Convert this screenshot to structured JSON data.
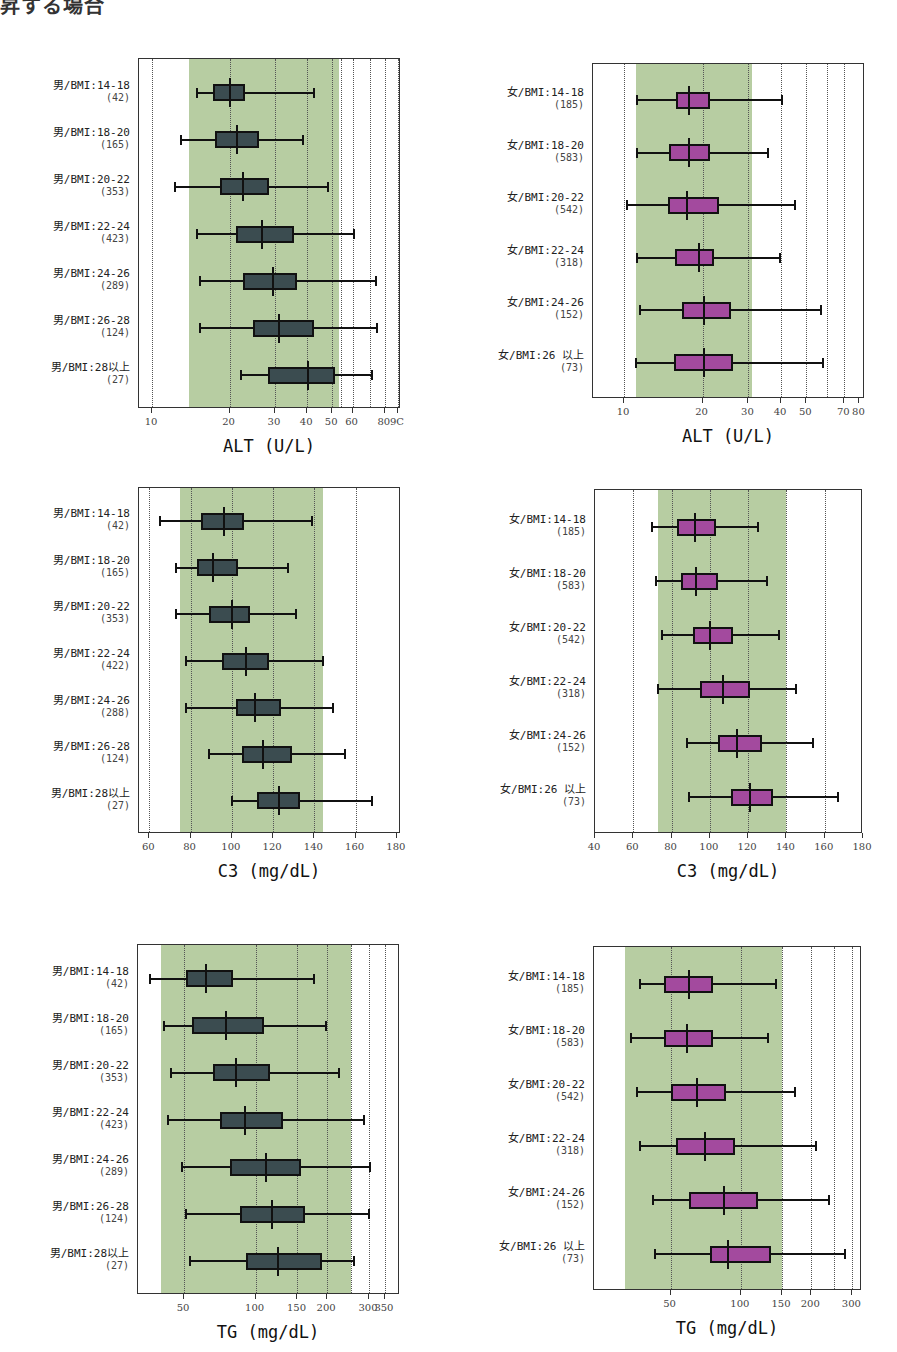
{
  "header": {
    "text": "昇する場合"
  },
  "colors": {
    "band": "#b7cda2",
    "male_box": "#3b4c50",
    "female_box": "#a34a9e",
    "axis": "#333333"
  },
  "chart_data": [
    {
      "id": "alt-male",
      "type": "boxplot",
      "scale": "log",
      "xlabel": "ALT (U/L)",
      "plot": {
        "left": 138,
        "top": 58,
        "width": 262,
        "height": 350
      },
      "domain": [
        8.9,
        92.5
      ],
      "ticks": [
        10,
        20,
        30,
        40,
        50,
        60,
        80,
        90
      ],
      "tick_labels": [
        "10",
        "20",
        "30",
        "40",
        "50",
        "60",
        "80",
        "9C"
      ],
      "grid": [
        10,
        20,
        30,
        40,
        50,
        54,
        60,
        70,
        80,
        90
      ],
      "reference_band": [
        13.9,
        53
      ],
      "box_color": "#3b4c50",
      "rows": [
        {
          "label": "男/BMI:14-18",
          "n": "(42)",
          "min": 14.9,
          "q1": 17.2,
          "median": 20.0,
          "q3": 22.9,
          "max": 42.5
        },
        {
          "label": "男/BMI:18-20",
          "n": "(165)",
          "min": 13.0,
          "q1": 17.5,
          "median": 21.3,
          "q3": 25.9,
          "max": 38.4
        },
        {
          "label": "男/BMI:20-22",
          "n": "(353)",
          "min": 12.3,
          "q1": 18.3,
          "median": 22.6,
          "q3": 28.4,
          "max": 48.2
        },
        {
          "label": "男/BMI:22-24",
          "n": "(423)",
          "min": 14.9,
          "q1": 21.1,
          "median": 26.7,
          "q3": 35.5,
          "max": 60.6
        },
        {
          "label": "男/BMI:24-26",
          "n": "(289)",
          "min": 15.4,
          "q1": 22.6,
          "median": 29.4,
          "q3": 36.4,
          "max": 74.2
        },
        {
          "label": "男/BMI:26-28",
          "n": "(124)",
          "min": 15.4,
          "q1": 24.7,
          "median": 31.0,
          "q3": 42.6,
          "max": 74.7
        },
        {
          "label": "男/BMI:28以上",
          "n": "(27)",
          "min": 22.1,
          "q1": 28.2,
          "median": 40.4,
          "q3": 51.3,
          "max": 71.4
        }
      ]
    },
    {
      "id": "alt-female",
      "type": "boxplot",
      "scale": "log",
      "xlabel": "ALT (U/L)",
      "plot": {
        "left": 592,
        "top": 63,
        "width": 272,
        "height": 335
      },
      "domain": [
        7.6,
        84
      ],
      "ticks": [
        10,
        20,
        30,
        40,
        50,
        70,
        80
      ],
      "tick_labels": [
        "10",
        "20",
        "30",
        "40",
        "50",
        "70",
        "80"
      ],
      "grid": [
        10,
        20,
        30,
        40,
        50,
        60,
        70
      ],
      "reference_band": [
        11.1,
        30.9
      ],
      "box_color": "#a34a9e",
      "rows": [
        {
          "label": "女/BMI:14-18",
          "n": "(185)",
          "min": 11.2,
          "q1": 15.8,
          "median": 17.7,
          "q3": 21.4,
          "max": 40.4
        },
        {
          "label": "女/BMI:18-20",
          "n": "(583)",
          "min": 11.2,
          "q1": 14.9,
          "median": 17.7,
          "q3": 21.4,
          "max": 35.7
        },
        {
          "label": "女/BMI:20-22",
          "n": "(542)",
          "min": 10.3,
          "q1": 14.8,
          "median": 17.5,
          "q3": 23.2,
          "max": 45.4
        },
        {
          "label": "女/BMI:22-24",
          "n": "(318)",
          "min": 11.2,
          "q1": 15.7,
          "median": 19.3,
          "q3": 22.2,
          "max": 39.6
        },
        {
          "label": "女/BMI:24-26",
          "n": "(152)",
          "min": 11.5,
          "q1": 16.7,
          "median": 20.2,
          "q3": 25.7,
          "max": 57.1
        },
        {
          "label": "女/BMI:26 以上",
          "n": "(73)",
          "min": 11.1,
          "q1": 15.5,
          "median": 20.2,
          "q3": 26.1,
          "max": 58.0
        }
      ]
    },
    {
      "id": "c3-male",
      "type": "boxplot",
      "scale": "linear",
      "xlabel": "C3 (mg/dL)",
      "plot": {
        "left": 138,
        "top": 487,
        "width": 262,
        "height": 346
      },
      "domain": [
        55,
        182
      ],
      "ticks": [
        60,
        80,
        100,
        120,
        140,
        160,
        180
      ],
      "tick_labels": [
        "60",
        "80",
        "100",
        "120",
        "140",
        "160",
        "180"
      ],
      "grid": [
        60,
        80,
        100,
        120,
        140,
        160
      ],
      "reference_band": [
        75,
        144
      ],
      "box_color": "#3b4c50",
      "rows": [
        {
          "label": "男/BMI:14-18",
          "n": "(42)",
          "min": 65,
          "q1": 85,
          "median": 96,
          "q3": 106,
          "max": 139
        },
        {
          "label": "男/BMI:18-20",
          "n": "(165)",
          "min": 73,
          "q1": 83,
          "median": 91,
          "q3": 103,
          "max": 127
        },
        {
          "label": "男/BMI:20-22",
          "n": "(353)",
          "min": 73,
          "q1": 89,
          "median": 100,
          "q3": 109,
          "max": 131
        },
        {
          "label": "男/BMI:22-24",
          "n": "(422)",
          "min": 78,
          "q1": 95,
          "median": 107,
          "q3": 118,
          "max": 144
        },
        {
          "label": "男/BMI:24-26",
          "n": "(288)",
          "min": 78,
          "q1": 102,
          "median": 111,
          "q3": 124,
          "max": 149
        },
        {
          "label": "男/BMI:26-28",
          "n": "(124)",
          "min": 89,
          "q1": 105,
          "median": 115,
          "q3": 129,
          "max": 155
        },
        {
          "label": "男/BMI:28以上",
          "n": "(27)",
          "min": 100,
          "q1": 112,
          "median": 123,
          "q3": 133,
          "max": 168
        }
      ]
    },
    {
      "id": "c3-female",
      "type": "boxplot",
      "scale": "linear",
      "xlabel": "C3 (mg/dL)",
      "plot": {
        "left": 594,
        "top": 489,
        "width": 268,
        "height": 344
      },
      "domain": [
        40,
        180
      ],
      "ticks": [
        40,
        60,
        80,
        100,
        120,
        140,
        160,
        180
      ],
      "tick_labels": [
        "40",
        "60",
        "80",
        "100",
        "120",
        "140",
        "160",
        "180"
      ],
      "grid": [
        60,
        80,
        100,
        120,
        140,
        160
      ],
      "reference_band": [
        73,
        140
      ],
      "box_color": "#a34a9e",
      "rows": [
        {
          "label": "女/BMI:14-18",
          "n": "(185)",
          "min": 70,
          "q1": 83,
          "median": 92,
          "q3": 103,
          "max": 125
        },
        {
          "label": "女/BMI:18-20",
          "n": "(583)",
          "min": 72,
          "q1": 85,
          "median": 93,
          "q3": 104,
          "max": 130
        },
        {
          "label": "女/BMI:20-22",
          "n": "(542)",
          "min": 75,
          "q1": 91,
          "median": 100,
          "q3": 112,
          "max": 136
        },
        {
          "label": "女/BMI:22-24",
          "n": "(318)",
          "min": 73,
          "q1": 95,
          "median": 107,
          "q3": 121,
          "max": 145
        },
        {
          "label": "女/BMI:24-26",
          "n": "(152)",
          "min": 88,
          "q1": 104,
          "median": 114,
          "q3": 127,
          "max": 154
        },
        {
          "label": "女/BMI:26 以上",
          "n": "(73)",
          "min": 89,
          "q1": 111,
          "median": 121,
          "q3": 133,
          "max": 167
        }
      ]
    },
    {
      "id": "tg-male",
      "type": "boxplot",
      "scale": "log",
      "xlabel": "TG (mg/dL)",
      "plot": {
        "left": 137,
        "top": 944,
        "width": 262,
        "height": 350
      },
      "domain": [
        32,
        405
      ],
      "ticks": [
        50,
        100,
        150,
        200,
        300,
        350
      ],
      "tick_labels": [
        "50",
        "100",
        "150",
        "200",
        "300",
        "350"
      ],
      "grid": [
        50,
        100,
        150,
        200,
        252,
        300,
        350
      ],
      "reference_band": [
        40,
        252
      ],
      "box_color": "#3b4c50",
      "rows": [
        {
          "label": "男/BMI:14-18",
          "n": "(42)",
          "min": 36,
          "q1": 51,
          "median": 62,
          "q3": 80,
          "max": 176
        },
        {
          "label": "男/BMI:18-20",
          "n": "(165)",
          "min": 41,
          "q1": 54,
          "median": 75,
          "q3": 108,
          "max": 197
        },
        {
          "label": "男/BMI:20-22",
          "n": "(353)",
          "min": 44,
          "q1": 66,
          "median": 83,
          "q3": 115,
          "max": 225
        },
        {
          "label": "男/BMI:22-24",
          "n": "(423)",
          "min": 43,
          "q1": 71,
          "median": 90,
          "q3": 130,
          "max": 287
        },
        {
          "label": "男/BMI:24-26",
          "n": "(289)",
          "min": 49,
          "q1": 78,
          "median": 111,
          "q3": 155,
          "max": 304
        },
        {
          "label": "男/BMI:26-28",
          "n": "(124)",
          "min": 51,
          "q1": 86,
          "median": 117,
          "q3": 162,
          "max": 301
        },
        {
          "label": "男/BMI:28以上",
          "n": "(27)",
          "min": 53,
          "q1": 91,
          "median": 124,
          "q3": 190,
          "max": 260
        }
      ]
    },
    {
      "id": "tg-female",
      "type": "boxplot",
      "scale": "log",
      "xlabel": "TG (mg/dL)",
      "plot": {
        "left": 593,
        "top": 946,
        "width": 268,
        "height": 344
      },
      "domain": [
        23.5,
        330
      ],
      "ticks": [
        50,
        100,
        150,
        200,
        300
      ],
      "tick_labels": [
        "50",
        "100",
        "150",
        "200",
        "300"
      ],
      "grid": [
        50,
        100,
        150,
        200,
        250,
        300
      ],
      "reference_band": [
        32,
        150
      ],
      "box_color": "#a34a9e",
      "rows": [
        {
          "label": "女/BMI:14-18",
          "n": "(185)",
          "min": 37,
          "q1": 47,
          "median": 60,
          "q3": 76,
          "max": 142
        },
        {
          "label": "女/BMI:18-20",
          "n": "(583)",
          "min": 34,
          "q1": 47,
          "median": 59,
          "q3": 76,
          "max": 131
        },
        {
          "label": "女/BMI:20-22",
          "n": "(542)",
          "min": 36,
          "q1": 50,
          "median": 65,
          "q3": 86,
          "max": 170
        },
        {
          "label": "女/BMI:22-24",
          "n": "(318)",
          "min": 37,
          "q1": 53,
          "median": 70,
          "q3": 94,
          "max": 209
        },
        {
          "label": "女/BMI:24-26",
          "n": "(152)",
          "min": 42,
          "q1": 60,
          "median": 85,
          "q3": 118,
          "max": 238
        },
        {
          "label": "女/BMI:26 以上",
          "n": "(73)",
          "min": 43,
          "q1": 74,
          "median": 88,
          "q3": 134,
          "max": 278
        }
      ]
    }
  ]
}
